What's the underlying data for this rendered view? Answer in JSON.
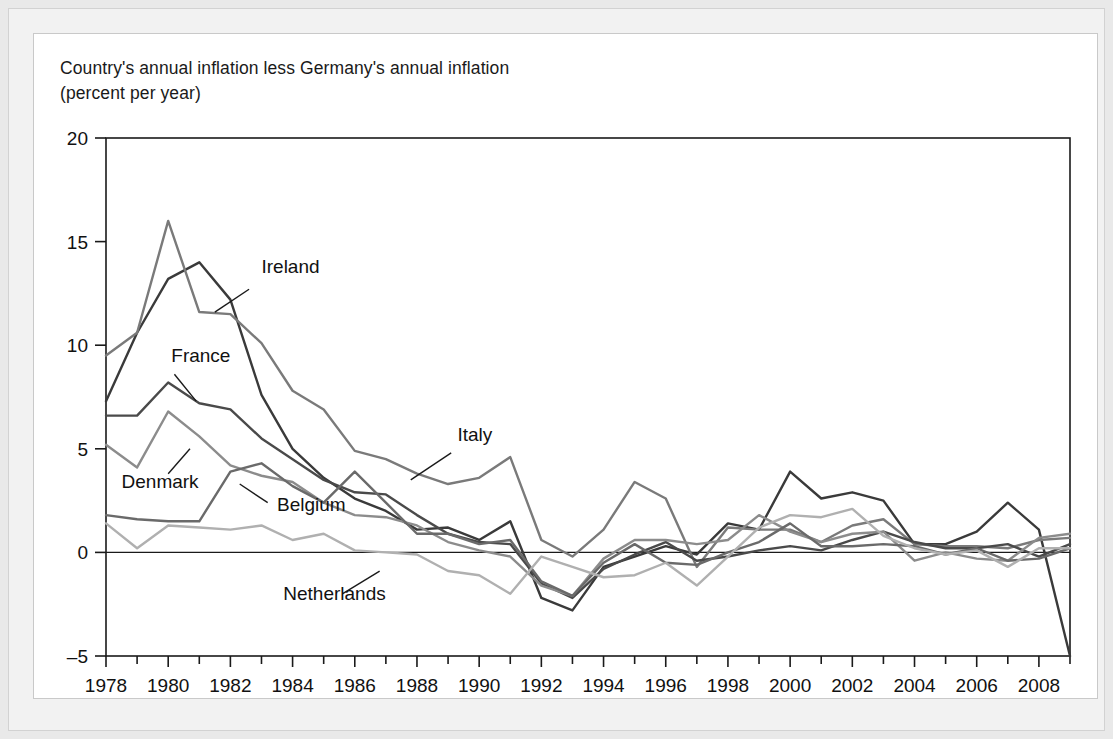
{
  "figure": {
    "title_line1": "Country's annual inflation less Germany's annual inflation",
    "title_line2": "(percent per year)"
  },
  "chart_data": {
    "type": "line",
    "title": "Country's annual inflation less Germany's annual inflation (percent per year)",
    "xlabel": "",
    "ylabel": "",
    "xlim": [
      1978,
      2009
    ],
    "ylim": [
      -5,
      20
    ],
    "yticks": [
      -5,
      0,
      5,
      10,
      15,
      20
    ],
    "ytick_labels": [
      "–5",
      "0",
      "5",
      "10",
      "15",
      "20"
    ],
    "xticks": [
      1978,
      1980,
      1982,
      1984,
      1986,
      1988,
      1990,
      1992,
      1994,
      1996,
      1998,
      2000,
      2002,
      2004,
      2006,
      2008
    ],
    "xtick_labels": [
      "1978",
      "1980",
      "1982",
      "1984",
      "1986",
      "1988",
      "1990",
      "1992",
      "1994",
      "1996",
      "1998",
      "2000",
      "2002",
      "2004",
      "2006",
      "2008"
    ],
    "minor_xticks_every": 1,
    "grid": false,
    "legend_position": "inline-annotations",
    "zero_line": true,
    "x": [
      1978,
      1979,
      1980,
      1981,
      1982,
      1983,
      1984,
      1985,
      1986,
      1987,
      1988,
      1989,
      1990,
      1991,
      1992,
      1993,
      1994,
      1995,
      1996,
      1997,
      1998,
      1999,
      2000,
      2001,
      2002,
      2003,
      2004,
      2005,
      2006,
      2007,
      2008,
      2009
    ],
    "series": [
      {
        "name": "Ireland",
        "color": "#3a3a3a",
        "label_x": 1983.0,
        "label_y": 13.5,
        "leader_from": [
          1982.6,
          12.7
        ],
        "leader_to": [
          1981.5,
          11.6
        ],
        "values": [
          7.3,
          10.6,
          13.2,
          14.0,
          12.2,
          7.6,
          5.0,
          3.6,
          2.6,
          2.0,
          1.1,
          1.2,
          0.6,
          1.5,
          -2.2,
          -2.8,
          -0.7,
          -0.2,
          0.3,
          -0.1,
          1.4,
          1.1,
          3.9,
          2.6,
          2.9,
          2.5,
          0.4,
          0.4,
          1.0,
          2.4,
          1.1,
          -5.0
        ]
      },
      {
        "name": "Italy",
        "color": "#7a7a7a",
        "label_x": 1989.3,
        "label_y": 5.4,
        "leader_from": [
          1989.1,
          4.8
        ],
        "leader_to": [
          1987.8,
          3.5
        ],
        "values": [
          9.5,
          10.6,
          16.0,
          11.6,
          11.5,
          10.1,
          7.8,
          6.9,
          4.9,
          4.5,
          3.8,
          3.3,
          3.6,
          4.6,
          0.6,
          -0.2,
          1.1,
          3.4,
          2.6,
          -0.7,
          1.2,
          1.1,
          1.1,
          0.5,
          1.3,
          1.6,
          0.4,
          0.3,
          0.3,
          0.2,
          0.6,
          0.7
        ]
      },
      {
        "name": "France",
        "color": "#4a4a4a",
        "label_x": 1980.1,
        "label_y": 9.2,
        "leader_from": [
          1980.2,
          8.6
        ],
        "leader_to": [
          1980.9,
          7.3
        ],
        "values": [
          6.6,
          6.6,
          8.2,
          7.2,
          6.9,
          5.5,
          4.5,
          3.5,
          2.9,
          2.8,
          1.8,
          0.9,
          0.5,
          0.4,
          -1.5,
          -2.2,
          -0.8,
          -0.1,
          0.5,
          -0.4,
          -0.2,
          0.1,
          0.3,
          0.1,
          0.6,
          1.0,
          0.5,
          0.2,
          0.2,
          0.4,
          -0.2,
          0.4
        ]
      },
      {
        "name": "Denmark",
        "color": "#8c8c8c",
        "label_x": 1978.5,
        "label_y": 3.1,
        "leader_from": [
          1980.0,
          3.8
        ],
        "leader_to": [
          1980.7,
          5.0
        ],
        "values": [
          5.2,
          4.1,
          6.8,
          5.6,
          4.2,
          3.7,
          3.4,
          2.4,
          1.8,
          1.7,
          1.3,
          0.5,
          0.1,
          -0.2,
          -1.6,
          -2.1,
          -0.3,
          0.6,
          0.6,
          0.4,
          0.6,
          1.8,
          1.0,
          0.5,
          0.9,
          1.0,
          -0.4,
          0.0,
          -0.3,
          -0.4,
          0.7,
          0.9
        ]
      },
      {
        "name": "Belgium",
        "color": "#6a6a6a",
        "label_x": 1983.5,
        "label_y": 2.0,
        "leader_from": [
          1983.2,
          2.4
        ],
        "leader_to": [
          1982.3,
          3.3
        ],
        "values": [
          1.8,
          1.6,
          1.5,
          1.5,
          3.9,
          4.3,
          3.2,
          2.4,
          3.9,
          2.4,
          0.9,
          0.9,
          0.4,
          0.6,
          -1.4,
          -2.1,
          -0.5,
          0.4,
          -0.5,
          -0.6,
          0.0,
          0.5,
          1.4,
          0.3,
          0.3,
          0.4,
          0.3,
          -0.1,
          0.2,
          -0.4,
          -0.3,
          0.2
        ]
      },
      {
        "name": "Netherlands",
        "color": "#b0b0b0",
        "label_x": 1983.7,
        "label_y": -2.3,
        "leader_from": [
          1985.6,
          -2.0
        ],
        "leader_to": [
          1986.8,
          -0.9
        ],
        "values": [
          1.4,
          0.2,
          1.3,
          1.2,
          1.1,
          1.3,
          0.6,
          0.9,
          0.1,
          0.0,
          -0.1,
          -0.9,
          -1.1,
          -2.0,
          -0.2,
          -0.7,
          -1.2,
          -1.1,
          -0.5,
          -1.6,
          -0.2,
          1.2,
          1.8,
          1.7,
          2.1,
          0.8,
          0.2,
          -0.1,
          0.1,
          -0.7,
          0.2,
          0.2
        ]
      }
    ]
  }
}
